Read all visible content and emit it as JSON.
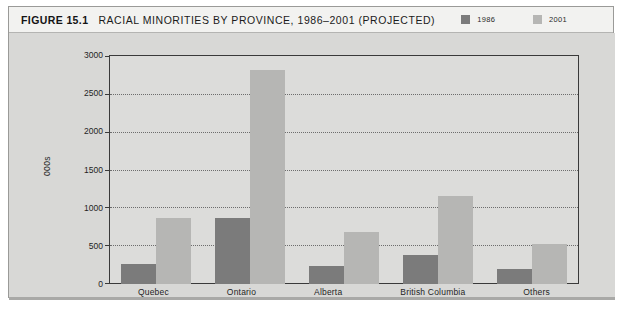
{
  "figure": {
    "number": "FIGURE 15.1",
    "title": "RACIAL MINORITIES BY PROVINCE, 1986–2001 (PROJECTED)"
  },
  "legend": {
    "items": [
      {
        "label": "1986",
        "color": "#7b7b7b",
        "swatch_name": "legend-swatch-1986"
      },
      {
        "label": "2001",
        "color": "#b6b6b4",
        "swatch_name": "legend-swatch-2001"
      }
    ]
  },
  "axis": {
    "y_label": "000s",
    "y_ticks": [
      "3000",
      "2500",
      "2000",
      "1500",
      "1000",
      "500",
      "0"
    ],
    "x_categories": [
      "Quebec",
      "Ontario",
      "Alberta",
      "British Columbia",
      "Others"
    ]
  },
  "chart_data": {
    "type": "bar",
    "title": "RACIAL MINORITIES BY PROVINCE, 1986–2001 (PROJECTED)",
    "xlabel": "",
    "ylabel": "000s",
    "ylim": [
      0,
      3000
    ],
    "ytick_step": 500,
    "grid": true,
    "legend_position": "top-right",
    "categories": [
      "Quebec",
      "Ontario",
      "Alberta",
      "British Columbia",
      "Others"
    ],
    "series": [
      {
        "name": "1986",
        "color": "#7b7b7b",
        "values": [
          265,
          870,
          235,
          380,
          200
        ]
      },
      {
        "name": "2001",
        "color": "#b6b6b4",
        "values": [
          865,
          2800,
          680,
          1150,
          520
        ]
      }
    ]
  }
}
